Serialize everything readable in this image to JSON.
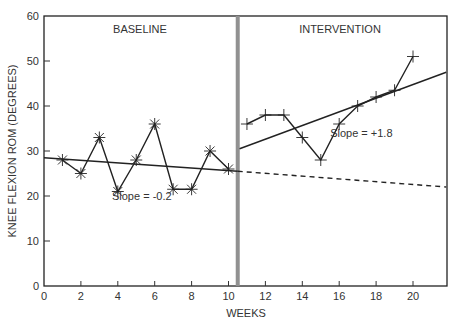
{
  "chart_data": {
    "type": "line",
    "title": "",
    "xlabel": "WEEKS",
    "ylabel": "KNEE FLEXION ROM (DEGREES)",
    "xlim": [
      0,
      21.8
    ],
    "ylim": [
      0,
      60
    ],
    "x_ticks": [
      0,
      2,
      4,
      6,
      8,
      10,
      12,
      14,
      16,
      18,
      20
    ],
    "y_ticks": [
      0,
      10,
      20,
      30,
      40,
      50,
      60
    ],
    "grid": false,
    "legend": null,
    "phase_change_x": 10.5,
    "phases": [
      {
        "label": "BASELINE",
        "x_range": [
          0,
          10.5
        ]
      },
      {
        "label": "INTERVENTION",
        "x_range": [
          10.5,
          21.8
        ]
      }
    ],
    "series": [
      {
        "name": "Baseline",
        "marker": "asterisk",
        "x": [
          1,
          2,
          3,
          4,
          5,
          6,
          7,
          8,
          9,
          10
        ],
        "values": [
          28,
          25,
          33,
          21,
          28,
          36,
          21.5,
          21.5,
          30,
          26
        ]
      },
      {
        "name": "Intervention",
        "marker": "plus",
        "x": [
          11,
          12,
          13,
          14,
          15,
          16,
          17,
          18,
          19,
          20
        ],
        "values": [
          36,
          38,
          38,
          33,
          28,
          36,
          40,
          42,
          43.5,
          51
        ]
      }
    ],
    "trend_lines": [
      {
        "name": "Baseline trend",
        "style": "solid",
        "x": [
          0,
          10.5
        ],
        "y": [
          28.5,
          25.5
        ],
        "slope_label": "Slope = -0.2"
      },
      {
        "name": "Baseline trend projected",
        "style": "dashed",
        "x": [
          10.5,
          21.8
        ],
        "y": [
          25.5,
          22
        ]
      },
      {
        "name": "Intervention trend",
        "style": "solid",
        "x": [
          10.6,
          21.8
        ],
        "y": [
          30.5,
          47.5
        ],
        "slope_label": "Slope = +1.8"
      }
    ],
    "annotations": [
      {
        "text": "Slope = -0.2",
        "x": 5.3,
        "y": 20
      },
      {
        "text": "Slope = +1.8",
        "x": 17.2,
        "y": 34
      }
    ]
  }
}
